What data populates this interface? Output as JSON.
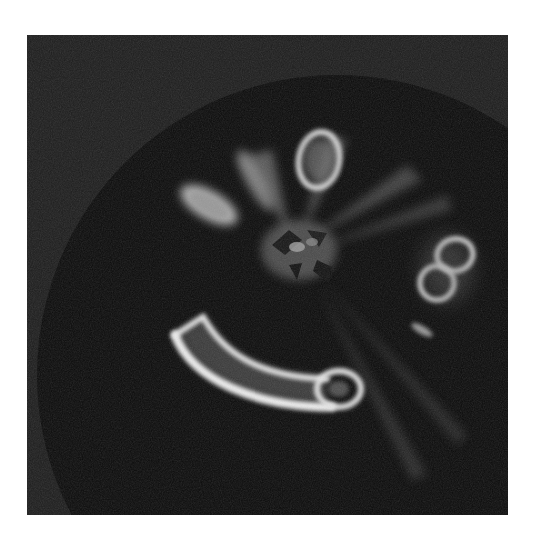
{
  "image": {
    "description": "Grayscale close-up photograph of the top of an apple with glowing bruise-like marks around the calyx, forming a face-like pattern",
    "colors": {
      "background": "#1a1a1a",
      "apple": "#0b0b0b",
      "glow": "#e6e6e6",
      "page": "#ffffff"
    }
  }
}
